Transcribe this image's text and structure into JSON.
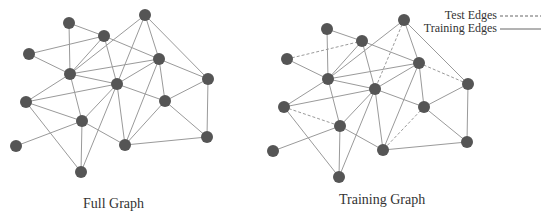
{
  "captions": {
    "full": "Full Graph",
    "training": "Training Graph"
  },
  "legend": {
    "test": "Test Edges",
    "training": "Training Edges"
  },
  "colors": {
    "node": "#555555",
    "edge": "#9a9a9a",
    "text": "#333333"
  },
  "graphs": {
    "full": {
      "nodes": {
        "A": [
          69,
          23
        ],
        "B": [
          104,
          36
        ],
        "C": [
          145,
          15
        ],
        "D": [
          29,
          54
        ],
        "E": [
          70,
          74
        ],
        "F": [
          159,
          59
        ],
        "G": [
          117,
          84
        ],
        "H": [
          208,
          79
        ],
        "I": [
          26,
          102
        ],
        "J": [
          165,
          101
        ],
        "K": [
          82,
          121
        ],
        "L": [
          16,
          146
        ],
        "M": [
          125,
          145
        ],
        "N": [
          207,
          137
        ],
        "O": [
          81,
          172
        ]
      }
    },
    "training": {
      "nodes": {
        "A": [
          327,
          29
        ],
        "B": [
          362,
          41
        ],
        "C": [
          404,
          20
        ],
        "D": [
          287,
          59
        ],
        "E": [
          328,
          79
        ],
        "F": [
          419,
          63
        ],
        "G": [
          375,
          89
        ],
        "H": [
          468,
          84
        ],
        "I": [
          284,
          107
        ],
        "J": [
          424,
          107
        ],
        "K": [
          340,
          126
        ],
        "L": [
          273,
          151
        ],
        "M": [
          383,
          150
        ],
        "N": [
          467,
          142
        ],
        "O": [
          339,
          177
        ]
      }
    }
  },
  "edges": [
    [
      "A",
      "B"
    ],
    [
      "A",
      "E"
    ],
    [
      "D",
      "B"
    ],
    [
      "D",
      "E"
    ],
    [
      "B",
      "E"
    ],
    [
      "B",
      "G"
    ],
    [
      "B",
      "F"
    ],
    [
      "C",
      "E"
    ],
    [
      "C",
      "G"
    ],
    [
      "C",
      "F"
    ],
    [
      "C",
      "H"
    ],
    [
      "E",
      "F"
    ],
    [
      "E",
      "G"
    ],
    [
      "G",
      "F"
    ],
    [
      "E",
      "I"
    ],
    [
      "E",
      "K"
    ],
    [
      "I",
      "G"
    ],
    [
      "I",
      "K"
    ],
    [
      "I",
      "O"
    ],
    [
      "K",
      "L"
    ],
    [
      "K",
      "O"
    ],
    [
      "K",
      "M"
    ],
    [
      "K",
      "G"
    ],
    [
      "G",
      "O"
    ],
    [
      "G",
      "M"
    ],
    [
      "G",
      "J"
    ],
    [
      "F",
      "H"
    ],
    [
      "F",
      "J"
    ],
    [
      "F",
      "M"
    ],
    [
      "J",
      "H"
    ],
    [
      "J",
      "N"
    ],
    [
      "J",
      "M"
    ],
    [
      "H",
      "N"
    ],
    [
      "M",
      "N"
    ]
  ],
  "test_edges": [
    [
      "D",
      "B"
    ],
    [
      "C",
      "G"
    ],
    [
      "I",
      "K"
    ],
    [
      "J",
      "M"
    ],
    [
      "F",
      "H"
    ]
  ]
}
